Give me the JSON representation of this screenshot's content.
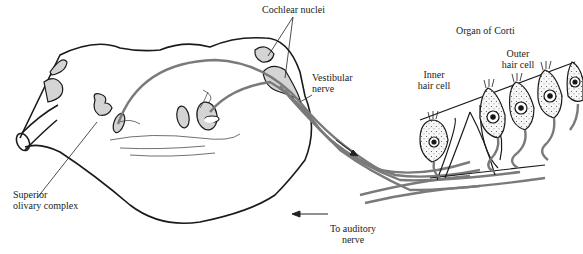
{
  "diagram": {
    "labels": {
      "cochlear_nuclei": "Cochlear nuclei",
      "vestibular_nerve_1": "Vestibular",
      "vestibular_nerve_2": "nerve",
      "organ_of_corti": "Organ of Corti",
      "outer_hair_cell_1": "Outer",
      "outer_hair_cell_2": "hair cell",
      "inner_hair_cell_1": "Inner",
      "inner_hair_cell_2": "hair cell",
      "superior_olivary_1": "Superior",
      "superior_olivary_2": "olivary complex",
      "to_auditory_nerve_1": "To auditory",
      "to_auditory_nerve_2": "nerve"
    },
    "colors": {
      "outline": "#1a1a1a",
      "nerve_gray": "#7a7a7a",
      "nucleus_fill": "#d4d4d4",
      "cell_fill": "#f2f2f2"
    }
  }
}
